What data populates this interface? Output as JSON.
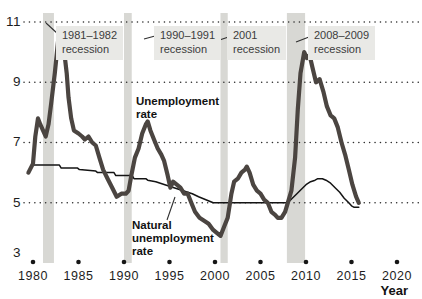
{
  "figure": {
    "y_axis_labels": [
      "11",
      "9",
      "7",
      "5",
      "3"
    ],
    "x_axis_labels": [
      "1980",
      "1985",
      "1990",
      "1995",
      "2000",
      "2005",
      "2010",
      "2015",
      "2020"
    ],
    "x_axis_title": "Year",
    "series_labels": {
      "unemployment": "Unemployment rate",
      "natural": "Natural unemployment rate"
    },
    "colors": {
      "unemployment_line": "#4b4541",
      "natural_line": "#141414",
      "recession_band": "#d8d8d4",
      "label_box_bg": "#e9e9e6",
      "grid_dot": "#2f2f2f",
      "axis_dot": "#161616",
      "text": "#1d1d1d"
    }
  },
  "chart_data": {
    "type": "line",
    "title": "",
    "xlabel": "Year",
    "ylabel": "Unemployment rate (percent)",
    "xlim": [
      1979,
      2021
    ],
    "ylim": [
      3,
      11
    ],
    "y_gridlines": [
      5,
      7,
      9,
      11
    ],
    "x_ticks": [
      1980,
      1985,
      1990,
      1995,
      2000,
      2005,
      2010,
      2015,
      2020
    ],
    "grid": "dotted-horizontal",
    "legend_position": "inline-annotations",
    "series": [
      {
        "name": "Natural unemployment rate",
        "color": "#141414",
        "stroke_width": 1.5,
        "points": [
          [
            1980.0,
            6.25
          ],
          [
            1982.9,
            6.25
          ],
          [
            1983.1,
            6.15
          ],
          [
            1984.9,
            6.15
          ],
          [
            1985.1,
            6.1
          ],
          [
            1986.9,
            6.05
          ],
          [
            1987.1,
            6.0
          ],
          [
            1988.9,
            6.0
          ],
          [
            1989.1,
            5.9
          ],
          [
            1990.9,
            5.9
          ],
          [
            1991.1,
            5.8
          ],
          [
            1992.4,
            5.8
          ],
          [
            1992.6,
            5.75
          ],
          [
            1993.5,
            5.7
          ],
          [
            1994.5,
            5.6
          ],
          [
            1995.5,
            5.5
          ],
          [
            1996.5,
            5.4
          ],
          [
            1997.5,
            5.3
          ],
          [
            1998.2,
            5.2
          ],
          [
            1999.0,
            5.1
          ],
          [
            1999.8,
            5.0
          ],
          [
            2008.0,
            5.0
          ],
          [
            2008.5,
            5.15
          ],
          [
            2009.0,
            5.3
          ],
          [
            2009.5,
            5.45
          ],
          [
            2010.0,
            5.6
          ],
          [
            2010.5,
            5.7
          ],
          [
            2011.0,
            5.75
          ],
          [
            2011.3,
            5.8
          ],
          [
            2011.8,
            5.8
          ],
          [
            2012.2,
            5.75
          ],
          [
            2012.7,
            5.65
          ],
          [
            2013.2,
            5.5
          ],
          [
            2013.7,
            5.35
          ],
          [
            2014.2,
            5.15
          ],
          [
            2014.7,
            5.0
          ],
          [
            2015.0,
            4.9
          ],
          [
            2015.3,
            4.85
          ],
          [
            2015.8,
            4.85
          ]
        ]
      },
      {
        "name": "Unemployment rate",
        "color": "#4b4541",
        "stroke_width": 4.2,
        "points": [
          [
            1979.5,
            6.0
          ],
          [
            1980.0,
            6.3
          ],
          [
            1980.25,
            7.2
          ],
          [
            1980.55,
            7.8
          ],
          [
            1980.8,
            7.6
          ],
          [
            1981.1,
            7.4
          ],
          [
            1981.4,
            7.2
          ],
          [
            1981.7,
            7.6
          ],
          [
            1982.0,
            8.3
          ],
          [
            1982.4,
            9.3
          ],
          [
            1982.9,
            10.8
          ],
          [
            1983.1,
            10.4
          ],
          [
            1983.4,
            10.1
          ],
          [
            1983.7,
            9.3
          ],
          [
            1983.9,
            8.5
          ],
          [
            1984.2,
            7.8
          ],
          [
            1984.5,
            7.4
          ],
          [
            1985.0,
            7.3
          ],
          [
            1985.4,
            7.2
          ],
          [
            1985.7,
            7.1
          ],
          [
            1986.1,
            7.2
          ],
          [
            1986.5,
            7.0
          ],
          [
            1986.9,
            6.9
          ],
          [
            1987.3,
            6.5
          ],
          [
            1987.7,
            6.1
          ],
          [
            1988.2,
            5.8
          ],
          [
            1988.7,
            5.5
          ],
          [
            1989.2,
            5.2
          ],
          [
            1989.7,
            5.3
          ],
          [
            1990.2,
            5.3
          ],
          [
            1990.5,
            5.4
          ],
          [
            1990.8,
            5.9
          ],
          [
            1991.2,
            6.5
          ],
          [
            1991.6,
            6.8
          ],
          [
            1992.0,
            7.3
          ],
          [
            1992.4,
            7.6
          ],
          [
            1992.6,
            7.7
          ],
          [
            1992.9,
            7.4
          ],
          [
            1993.3,
            7.1
          ],
          [
            1993.7,
            6.8
          ],
          [
            1994.1,
            6.6
          ],
          [
            1994.4,
            6.4
          ],
          [
            1994.8,
            5.9
          ],
          [
            1995.1,
            5.5
          ],
          [
            1995.4,
            5.7
          ],
          [
            1995.8,
            5.6
          ],
          [
            1996.2,
            5.5
          ],
          [
            1996.6,
            5.3
          ],
          [
            1997.0,
            5.3
          ],
          [
            1997.4,
            5.0
          ],
          [
            1997.8,
            4.7
          ],
          [
            1998.3,
            4.5
          ],
          [
            1998.8,
            4.4
          ],
          [
            1999.3,
            4.3
          ],
          [
            1999.8,
            4.1
          ],
          [
            2000.2,
            4.0
          ],
          [
            2000.6,
            3.9
          ],
          [
            2001.0,
            4.2
          ],
          [
            2001.4,
            4.5
          ],
          [
            2001.8,
            5.3
          ],
          [
            2002.1,
            5.7
          ],
          [
            2002.5,
            5.8
          ],
          [
            2002.9,
            6.0
          ],
          [
            2003.3,
            6.1
          ],
          [
            2003.5,
            6.2
          ],
          [
            2003.8,
            6.0
          ],
          [
            2004.2,
            5.6
          ],
          [
            2004.6,
            5.4
          ],
          [
            2005.0,
            5.3
          ],
          [
            2005.4,
            5.1
          ],
          [
            2005.8,
            5.0
          ],
          [
            2006.2,
            4.7
          ],
          [
            2006.6,
            4.6
          ],
          [
            2006.9,
            4.5
          ],
          [
            2007.3,
            4.5
          ],
          [
            2007.7,
            4.7
          ],
          [
            2008.0,
            5.0
          ],
          [
            2008.4,
            5.4
          ],
          [
            2008.8,
            6.5
          ],
          [
            2009.1,
            8.1
          ],
          [
            2009.4,
            9.3
          ],
          [
            2009.8,
            10.0
          ],
          [
            2010.1,
            9.8
          ],
          [
            2010.4,
            9.9
          ],
          [
            2010.7,
            9.5
          ],
          [
            2011.1,
            9.0
          ],
          [
            2011.5,
            9.1
          ],
          [
            2011.9,
            8.7
          ],
          [
            2012.3,
            8.2
          ],
          [
            2012.7,
            7.9
          ],
          [
            2013.1,
            7.8
          ],
          [
            2013.5,
            7.5
          ],
          [
            2013.9,
            7.0
          ],
          [
            2014.3,
            6.6
          ],
          [
            2014.7,
            6.1
          ],
          [
            2015.1,
            5.6
          ],
          [
            2015.5,
            5.2
          ],
          [
            2015.8,
            5.0
          ]
        ]
      }
    ],
    "recessions": [
      {
        "label_line1": "1981–1982",
        "label_line2": "recession",
        "start": 1981.1,
        "end": 1982.3
      },
      {
        "label_line1": "1990–1991",
        "label_line2": "recession",
        "start": 1990.0,
        "end": 1990.85
      },
      {
        "label_line1": "2001",
        "label_line2": "recession",
        "start": 2000.6,
        "end": 2001.4
      },
      {
        "label_line1": "2008–2009",
        "label_line2": "recession",
        "start": 2007.9,
        "end": 2009.9
      }
    ]
  }
}
